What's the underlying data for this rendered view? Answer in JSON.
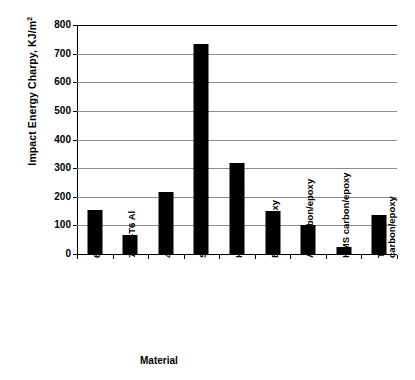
{
  "chart_data": {
    "type": "bar",
    "title": "",
    "xlabel": "Material",
    "ylabel": "Impact Energy Charpy, KJ/m",
    "ylabel_superscript": "2",
    "categories": [
      "6061-T6 Al",
      "7075-T6 Al",
      "4340 Steel",
      "S Glass/epoxy",
      "Kevlar 49/epoxy",
      "Boron/epoxy",
      "AS Carbon/epoxy",
      "HMS carbon/epoxy",
      "T-300\ncarbon/epoxy"
    ],
    "values": [
      155,
      65,
      217,
      735,
      318,
      150,
      100,
      25,
      135
    ],
    "ylim": [
      0,
      800
    ],
    "ytick_values": [
      0,
      100,
      200,
      300,
      400,
      500,
      600,
      700,
      800
    ],
    "ytick_labels": [
      "0",
      "100",
      "200",
      "300",
      "400",
      "500",
      "600",
      "700",
      "800"
    ],
    "grid": true,
    "grid_axis": "y",
    "legend": false,
    "bar_color": "#000000",
    "grid_color": "#8d8d8d",
    "axis_color": "#000000",
    "background_color": "#ffffff"
  }
}
